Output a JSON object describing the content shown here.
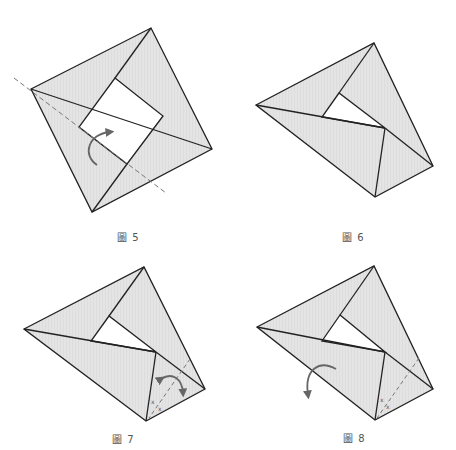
{
  "figures": [
    {
      "id": "fig5",
      "label": "圖 5",
      "step": "Fold along dashed line (valley fold)",
      "arrow": "fold-over"
    },
    {
      "id": "fig6",
      "label": "圖 6",
      "step": "Result after folding"
    },
    {
      "id": "fig7",
      "label": "圖 7",
      "step": "Fold and unfold along dashed line",
      "marks": [
        "x",
        "x"
      ]
    },
    {
      "id": "fig8",
      "label": "圖 8",
      "step": "Turn over",
      "marks": [
        "x",
        "x"
      ]
    }
  ],
  "colors": {
    "paper_fill": "#e6e6e6",
    "line": "#222222",
    "dash": "#777777",
    "arrow": "#666666",
    "label": "#555555"
  }
}
